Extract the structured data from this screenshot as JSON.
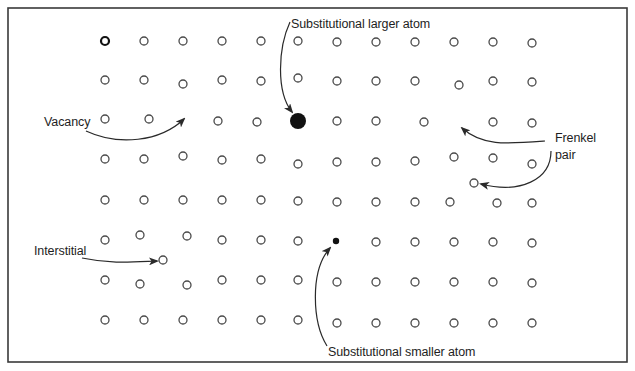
{
  "diagram": {
    "colors": {
      "frame": "#3a3a3a",
      "atom_stroke": "#4a4a4a",
      "atom_fill": "#ffffff",
      "filled_atom": "#111111",
      "arrow": "#2a2a2a",
      "text": "#1e1e1e"
    },
    "frame": {
      "x": 8,
      "y": 8,
      "width": 619,
      "height": 354
    },
    "labels": {
      "substitutional_larger": "Substitutional larger atom",
      "vacancy": "Vacancy",
      "frenkel_line1": "Frenkel",
      "frenkel_line2": "pair",
      "interstitial": "Interstitial",
      "substitutional_smaller": "Substitutional smaller atom"
    },
    "atom_radius": 4,
    "atoms": [
      [
        105,
        41,
        "bold"
      ],
      [
        144,
        41
      ],
      [
        183,
        41
      ],
      [
        222,
        41
      ],
      [
        261,
        41
      ],
      [
        298,
        41
      ],
      [
        337,
        42
      ],
      [
        376,
        42
      ],
      [
        415,
        42
      ],
      [
        454,
        42
      ],
      [
        493,
        42
      ],
      [
        532,
        43
      ],
      [
        105,
        80
      ],
      [
        144,
        80
      ],
      [
        183,
        84
      ],
      [
        222,
        80
      ],
      [
        261,
        81
      ],
      [
        298,
        78
      ],
      [
        337,
        81
      ],
      [
        376,
        81
      ],
      [
        415,
        81
      ],
      [
        459,
        85
      ],
      [
        493,
        81
      ],
      [
        532,
        82
      ],
      [
        105,
        119
      ],
      [
        149,
        119
      ],
      [
        218,
        121
      ],
      [
        257,
        122
      ],
      [
        337,
        121
      ],
      [
        376,
        121
      ],
      [
        424,
        122
      ],
      [
        493,
        122
      ],
      [
        532,
        123
      ],
      [
        105,
        159
      ],
      [
        144,
        159
      ],
      [
        183,
        156
      ],
      [
        222,
        160
      ],
      [
        261,
        159
      ],
      [
        298,
        164
      ],
      [
        337,
        162
      ],
      [
        376,
        162
      ],
      [
        415,
        161
      ],
      [
        454,
        157
      ],
      [
        493,
        158
      ],
      [
        532,
        164
      ],
      [
        105,
        200
      ],
      [
        144,
        200
      ],
      [
        183,
        200
      ],
      [
        222,
        200
      ],
      [
        261,
        200
      ],
      [
        298,
        201
      ],
      [
        337,
        202
      ],
      [
        376,
        202
      ],
      [
        415,
        202
      ],
      [
        450,
        202
      ],
      [
        497,
        203
      ],
      [
        532,
        203
      ],
      [
        105,
        240
      ],
      [
        140,
        235
      ],
      [
        187,
        236
      ],
      [
        222,
        240
      ],
      [
        261,
        240
      ],
      [
        298,
        241
      ],
      [
        376,
        242
      ],
      [
        415,
        242
      ],
      [
        454,
        242
      ],
      [
        493,
        242
      ],
      [
        532,
        243
      ],
      [
        105,
        280
      ],
      [
        140,
        284
      ],
      [
        187,
        285
      ],
      [
        222,
        280
      ],
      [
        261,
        280
      ],
      [
        298,
        280
      ],
      [
        337,
        282
      ],
      [
        376,
        282
      ],
      [
        415,
        282
      ],
      [
        454,
        282
      ],
      [
        493,
        282
      ],
      [
        532,
        283
      ],
      [
        105,
        320
      ],
      [
        144,
        320
      ],
      [
        183,
        320
      ],
      [
        222,
        320
      ],
      [
        261,
        320
      ],
      [
        298,
        320
      ],
      [
        337,
        323
      ],
      [
        376,
        323
      ],
      [
        415,
        323
      ],
      [
        454,
        323
      ],
      [
        493,
        323
      ],
      [
        532,
        323
      ]
    ],
    "defects": {
      "large_substitutional": {
        "x": 298,
        "y": 121,
        "r": 8
      },
      "small_substitutional": {
        "x": 336,
        "y": 241,
        "r": 3.2
      },
      "interstitial": {
        "x": 163,
        "y": 260,
        "r": 4
      },
      "frenkel_interstitial": {
        "x": 474,
        "y": 183,
        "r": 4
      }
    }
  }
}
